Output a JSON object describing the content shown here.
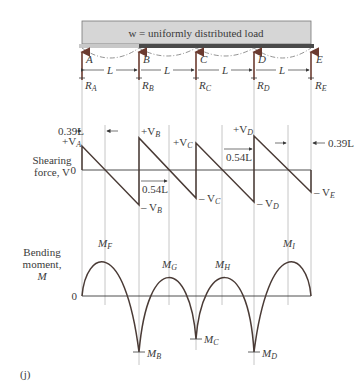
{
  "figure": {
    "panel_label": "(j)",
    "load_label": "w = uniformly distributed load",
    "span_label": "L",
    "supports": [
      {
        "name": "A",
        "reaction": "R",
        "reaction_sub": "A"
      },
      {
        "name": "B",
        "reaction": "R",
        "reaction_sub": "B"
      },
      {
        "name": "C",
        "reaction": "R",
        "reaction_sub": "C"
      },
      {
        "name": "D",
        "reaction": "R",
        "reaction_sub": "D"
      },
      {
        "name": "E",
        "reaction": "R",
        "reaction_sub": "E"
      }
    ],
    "shear": {
      "axis_label_line1": "Shearing",
      "axis_label_line2": "force, V",
      "zero_label": "0",
      "dim_039_left": "0.39L",
      "dim_039_right": "0.39L",
      "dim_054_a": "0.54L",
      "dim_054_b": "0.54L",
      "labels": {
        "va_pos": "+V",
        "va_sub": "A",
        "vb_pos": "+V",
        "vb_sub": "B",
        "vb_neg": "– V",
        "vc_pos": "+V",
        "vc_sub": "C",
        "vc_neg": "– V",
        "vd_pos": "+V",
        "vd_sub": "D",
        "vd_neg": "– V",
        "ve_neg": "– V",
        "ve_sub": "E"
      }
    },
    "moment": {
      "axis_label_line1": "Bending",
      "axis_label_line2": "moment,",
      "axis_label_line3": "M",
      "zero_label": "0",
      "labels": {
        "mf": "M",
        "mf_sub": "F",
        "mg": "M",
        "mg_sub": "G",
        "mh": "M",
        "mh_sub": "H",
        "mi": "M",
        "mi_sub": "I",
        "mb": "M",
        "mb_sub": "B",
        "mc": "M",
        "mc_sub": "C",
        "md": "M",
        "md_sub": "D"
      }
    },
    "colors": {
      "beam_fill": "#d6d6d6",
      "beam_bar": "#4a4a4a",
      "curve": "#4a3b36",
      "reaction_arrow": "#6b3b30",
      "guide_lines": "#b8b8b8"
    }
  }
}
